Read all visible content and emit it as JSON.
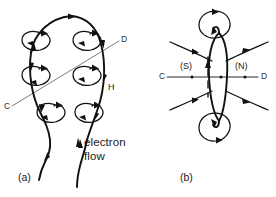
{
  "figure": {
    "background_color": "#ffffff",
    "ink_color": "#111111",
    "axis_color": "#7b7b7b",
    "width": 276,
    "height": 197
  },
  "panel_a": {
    "caption": "(a)",
    "axis_start_label": "C",
    "axis_end_label": "D",
    "field_label": "H",
    "flow_label_line1": "electron",
    "flow_label_line2": "flow",
    "description": "Current-carrying wire bent into a loop with circular magnetic field orbits encircling the conductor at six points",
    "orbit_count": 6,
    "arrow_count": 12
  },
  "panel_b": {
    "caption": "(b)",
    "axis_start_label": "C",
    "axis_end_label": "D",
    "south_pole_label": "(S)",
    "north_pole_label": "(N)",
    "description": "Edge-on view of the same loop showing magnetic field lines emerging at the north pole and entering at the south pole",
    "field_line_count": 4,
    "orbit_count": 2
  }
}
